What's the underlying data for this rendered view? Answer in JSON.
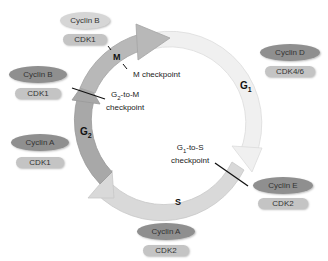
{
  "diagram": {
    "phases": [
      {
        "id": "M",
        "label": "M"
      },
      {
        "id": "G1",
        "label": "G",
        "sub": "1"
      },
      {
        "id": "S",
        "label": "S"
      },
      {
        "id": "G2",
        "label": "G",
        "sub": "2"
      }
    ],
    "checkpoints": [
      {
        "id": "m",
        "label": "M checkpoint"
      },
      {
        "id": "g2m",
        "line1_pre": "G",
        "line1_sub": "2",
        "line1_post": "-to-M",
        "line2": "checkpoint"
      },
      {
        "id": "g1s",
        "line1_pre": "G",
        "line1_sub": "1",
        "line1_post": "-to-S",
        "line2": "checkpoint"
      }
    ],
    "complexes": [
      {
        "id": "top",
        "cyclin": "Cyclin B",
        "cdk": "CDK1"
      },
      {
        "id": "left_upper",
        "cyclin": "Cyclin B",
        "cdk": "CDK1"
      },
      {
        "id": "left_lower",
        "cyclin": "Cyclin A",
        "cdk": "CDK1"
      },
      {
        "id": "bottom",
        "cyclin": "Cyclin A",
        "cdk": "CDK2"
      },
      {
        "id": "right_lower",
        "cyclin": "Cyclin E",
        "cdk": "CDK2"
      },
      {
        "id": "right_upper",
        "cyclin": "Cyclin D",
        "cdk": "CDK4/6"
      }
    ],
    "colors": {
      "arc_g1": "#f0f0f0",
      "arc_s": "#d9d9d9",
      "arc_g2": "#a8a8a8",
      "arc_m": "#b8b8b8",
      "cyclin_dark": "#8f8f8f",
      "cyclin_light": "#d6d6d6",
      "cdk": "#c4c4c4"
    }
  }
}
